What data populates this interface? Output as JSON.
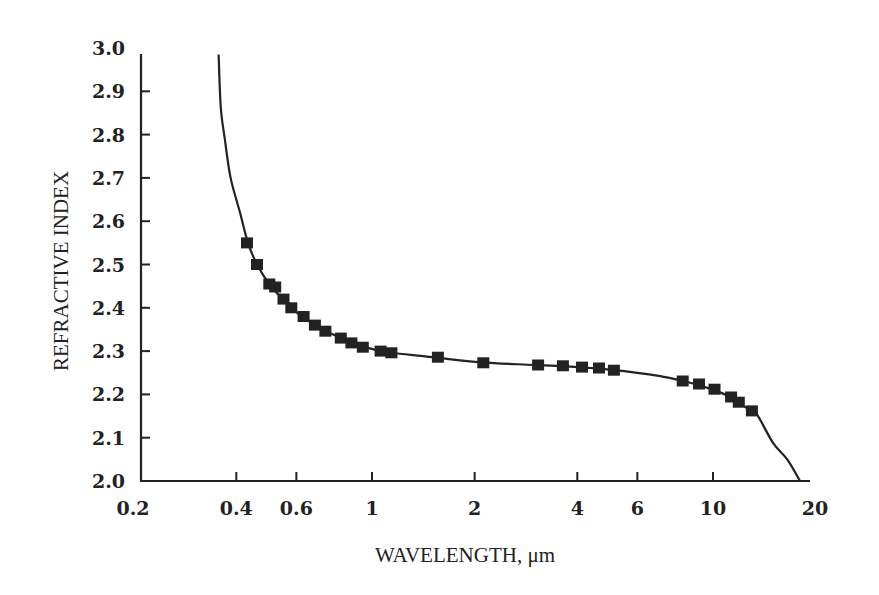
{
  "chart_data": {
    "type": "scatter",
    "title": "",
    "xlabel": "WAVELENGTH, μm",
    "ylabel": "REFRACTIVE INDEX",
    "xscale": "log",
    "xlim": [
      0.2,
      20
    ],
    "ylim": [
      2.0,
      3.0
    ],
    "grid": false,
    "legend": null,
    "x_ticks": [
      0.2,
      0.4,
      0.6,
      1,
      2,
      4,
      6,
      10,
      20
    ],
    "x_tick_labels": [
      "0.2",
      "0.4",
      "0.6",
      "1",
      "2",
      "4",
      "6",
      "10",
      "20"
    ],
    "y_ticks": [
      2.0,
      2.1,
      2.2,
      2.3,
      2.4,
      2.5,
      2.6,
      2.7,
      2.8,
      2.9,
      3.0
    ],
    "y_tick_labels": [
      "2.0",
      "2.1",
      "2.2",
      "2.3",
      "2.4",
      "2.5",
      "2.6",
      "2.7",
      "2.8",
      "2.9",
      "3.0"
    ],
    "series": [
      {
        "name": "measured",
        "kind": "markers",
        "marker": "square",
        "x": [
          0.43,
          0.46,
          0.5,
          0.52,
          0.55,
          0.58,
          0.63,
          0.68,
          0.73,
          0.81,
          0.87,
          0.94,
          1.06,
          1.14,
          1.56,
          2.12,
          3.07,
          3.63,
          4.13,
          4.63,
          5.12,
          8.15,
          9.1,
          10.1,
          11.3,
          11.9,
          13.0
        ],
        "y": [
          2.55,
          2.5,
          2.455,
          2.448,
          2.42,
          2.4,
          2.38,
          2.36,
          2.346,
          2.33,
          2.319,
          2.309,
          2.3,
          2.296,
          2.286,
          2.273,
          2.268,
          2.266,
          2.263,
          2.261,
          2.256,
          2.231,
          2.224,
          2.212,
          2.194,
          2.182,
          2.162
        ]
      },
      {
        "name": "fit",
        "kind": "line",
        "x": [
          0.355,
          0.36,
          0.37,
          0.385,
          0.41,
          0.433,
          0.46,
          0.5,
          0.55,
          0.6,
          0.68,
          0.8,
          0.95,
          1.1,
          1.5,
          2.1,
          3.0,
          4.0,
          5.0,
          6.0,
          7.0,
          8.2,
          10.0,
          11.3,
          13.0,
          13.5,
          15.0,
          16.5,
          18.0
        ],
        "y": [
          2.985,
          2.865,
          2.79,
          2.7,
          2.62,
          2.55,
          2.5,
          2.455,
          2.418,
          2.39,
          2.36,
          2.332,
          2.31,
          2.298,
          2.286,
          2.274,
          2.268,
          2.263,
          2.257,
          2.25,
          2.242,
          2.231,
          2.211,
          2.193,
          2.16,
          2.152,
          2.088,
          2.05,
          2.0
        ]
      }
    ]
  },
  "colors": {
    "ink": "#222222",
    "background": "#ffffff"
  }
}
